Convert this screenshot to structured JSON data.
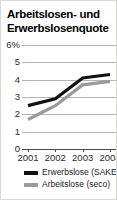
{
  "figure": {
    "title": "Arbeitslosen- und Erwerbslosenquote"
  },
  "chart_data": {
    "type": "line",
    "title": "Arbeitslosen- und Erwerbslosenquote",
    "xlabel": "",
    "ylabel": "",
    "categories": [
      "2001",
      "2002",
      "2003",
      "2004"
    ],
    "x_tick_labels": [
      "2001",
      "2002",
      "2003",
      "2004"
    ],
    "y_tick_labels": [
      "6%",
      "5",
      "4",
      "3",
      "2",
      "1",
      "0"
    ],
    "y_tick_values": [
      6,
      5,
      4,
      3,
      2,
      1,
      0
    ],
    "ylim": [
      0,
      6
    ],
    "grid": true,
    "legend_position": "bottom",
    "series": [
      {
        "name": "Erwerbslose (SAKE)",
        "color": "#111111",
        "values": [
          2.5,
          2.9,
          4.1,
          4.3
        ]
      },
      {
        "name": "Arbeitslose (seco)",
        "color": "#9a9a9a",
        "values": [
          1.7,
          2.5,
          3.7,
          3.9
        ]
      }
    ]
  },
  "legend": {
    "items": [
      {
        "label": "Erwerbslose (SAKE)",
        "color": "#111111"
      },
      {
        "label": "Arbeitslose (seco)",
        "color": "#9a9a9a"
      }
    ]
  }
}
